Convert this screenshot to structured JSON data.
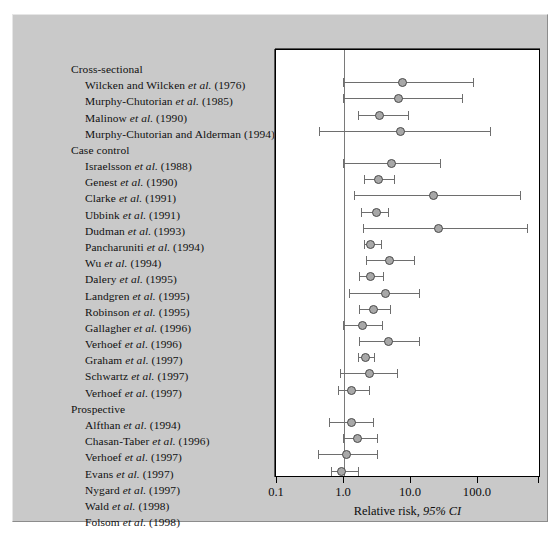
{
  "figure": {
    "background_color": "#c9c9c9",
    "plot_background_color": "#ffffff",
    "marker_color": "#a8a8a8",
    "marker_edge_color": "#4a4a4a",
    "line_color": "#6e6e6e",
    "reference_line_color": "#7a7a7a"
  },
  "axis": {
    "xlabel_plain": "Relative risk,",
    "xlabel_italic": "95% CI",
    "ticks": [
      "0.1",
      "1.0",
      "10.0",
      "100.0"
    ],
    "tick_values": [
      0.1,
      1.0,
      10.0,
      100.0
    ],
    "reference_value": "1.0"
  },
  "groups": [
    {
      "name": "Cross-sectional"
    },
    {
      "name": "Case control"
    },
    {
      "name": "Prospective"
    }
  ],
  "chart_data": {
    "type": "forest",
    "title": "",
    "xlabel": "Relative risk, 95% CI",
    "ylabel": "",
    "xscale": "log",
    "xlim": [
      0.1,
      400
    ],
    "xticks": [
      0.1,
      1.0,
      10.0,
      100.0
    ],
    "xticklabels": [
      "0.1",
      "1.0",
      "10.0",
      "100.0"
    ],
    "reference_line": 1.0,
    "grid": false,
    "legend": null,
    "groups": [
      "Cross-sectional",
      "Case control",
      "Prospective"
    ],
    "rows": [
      {
        "kind": "group",
        "label": "Cross-sectional"
      },
      {
        "kind": "study",
        "group": "Cross-sectional",
        "label_name": "Wilcken and Wilcken",
        "label_etal": "et al.",
        "label_year": "(1976)",
        "label": "Wilcken and Wilcken et al. (1976)",
        "rr": 7.4,
        "ci_low": 0.97,
        "ci_high": 83.0
      },
      {
        "kind": "study",
        "group": "Cross-sectional",
        "label_name": "Murphy-Chutorian",
        "label_etal": "et al.",
        "label_year": "(1985)",
        "label": "Murphy-Chutorian et al. (1985)",
        "rr": 6.5,
        "ci_low": 0.97,
        "ci_high": 58.0
      },
      {
        "kind": "study",
        "group": "Cross-sectional",
        "label_name": "Malinow",
        "label_etal": "et al.",
        "label_year": "(1990)",
        "label": "Malinow et al. (1990)",
        "rr": 3.4,
        "ci_low": 1.6,
        "ci_high": 8.9
      },
      {
        "kind": "study",
        "group": "Cross-sectional",
        "label_name": "Murphy-Chutorian and Alderman",
        "label_etal": "",
        "label_year": "(1994)",
        "label": "Murphy-Chutorian and Alderman (1994)",
        "rr": 6.9,
        "ci_low": 0.43,
        "ci_high": 150.0
      },
      {
        "kind": "group",
        "label": "Case control"
      },
      {
        "kind": "study",
        "group": "Case control",
        "label_name": "Israelsson",
        "label_etal": "et al.",
        "label_year": "(1988)",
        "label": "Israelsson et al. (1988)",
        "rr": 5.2,
        "ci_low": 0.97,
        "ci_high": 27.0
      },
      {
        "kind": "study",
        "group": "Case control",
        "label_name": "Genest",
        "label_etal": "et al.",
        "label_year": "(1990)",
        "label": "Genest et al. (1990)",
        "rr": 3.3,
        "ci_low": 2.0,
        "ci_high": 5.6
      },
      {
        "kind": "study",
        "group": "Case control",
        "label_name": "Clarke",
        "label_etal": "et al.",
        "label_year": "(1991)",
        "label": "Clarke et al. (1991)",
        "rr": 22.0,
        "ci_low": 1.4,
        "ci_high": 420.0
      },
      {
        "kind": "study",
        "group": "Case control",
        "label_name": "Ubbink",
        "label_etal": "et al.",
        "label_year": "(1991)",
        "label": "Ubbink et al. (1991)",
        "rr": 3.1,
        "ci_low": 1.8,
        "ci_high": 4.6
      },
      {
        "kind": "study",
        "group": "Case control",
        "label_name": "Dudman",
        "label_etal": "et al.",
        "label_year": "(1993)",
        "label": "Dudman et al. (1993)",
        "rr": 26.0,
        "ci_low": 1.9,
        "ci_high": 540.0
      },
      {
        "kind": "study",
        "group": "Case control",
        "label_name": "Pancharuniti",
        "label_etal": "et al.",
        "label_year": "(1994)",
        "label": "Pancharuniti et al. (1994)",
        "rr": 2.5,
        "ci_low": 2.0,
        "ci_high": 3.6
      },
      {
        "kind": "study",
        "group": "Case control",
        "label_name": "Wu",
        "label_etal": "et al.",
        "label_year": "(1994)",
        "label": "Wu et al. (1994)",
        "rr": 4.8,
        "ci_low": 2.1,
        "ci_high": 11.0
      },
      {
        "kind": "study",
        "group": "Case control",
        "label_name": "Dalery",
        "label_etal": "et al.",
        "label_year": "(1995)",
        "label": "Dalery et al. (1995)",
        "rr": 2.5,
        "ci_low": 1.7,
        "ci_high": 3.8
      },
      {
        "kind": "study",
        "group": "Case control",
        "label_name": "Landgren",
        "label_etal": "et al.",
        "label_year": "(1995)",
        "label": "Landgren et al. (1995)",
        "rr": 4.1,
        "ci_low": 1.2,
        "ci_high": 13.0
      },
      {
        "kind": "study",
        "group": "Case control",
        "label_name": "Robinson",
        "label_etal": "et al.",
        "label_year": "(1995)",
        "label": "Robinson et al. (1995)",
        "rr": 2.8,
        "ci_low": 1.7,
        "ci_high": 4.8
      },
      {
        "kind": "study",
        "group": "Case control",
        "label_name": "Gallagher",
        "label_etal": "et al.",
        "label_year": "(1996)",
        "label": "Gallagher et al. (1996)",
        "rr": 1.9,
        "ci_low": 0.97,
        "ci_high": 3.7
      },
      {
        "kind": "study",
        "group": "Case control",
        "label_name": "Verhoef",
        "label_etal": "et al.",
        "label_year": "(1996)",
        "label": "Verhoef et al. (1996)",
        "rr": 4.6,
        "ci_low": 1.7,
        "ci_high": 13.0
      },
      {
        "kind": "study",
        "group": "Case control",
        "label_name": "Graham",
        "label_etal": "et al.",
        "label_year": "(1997)",
        "label": "Graham et al. (1997)",
        "rr": 2.1,
        "ci_low": 1.6,
        "ci_high": 2.8
      },
      {
        "kind": "study",
        "group": "Case control",
        "label_name": "Schwartz",
        "label_etal": "et al.",
        "label_year": "(1997)",
        "label": "Schwartz et al. (1997)",
        "rr": 2.4,
        "ci_low": 0.87,
        "ci_high": 6.1
      },
      {
        "kind": "study",
        "group": "Case control",
        "label_name": "Verhoef",
        "label_etal": "et al.",
        "label_year": "(1997)",
        "label": "Verhoef et al. (1997)",
        "rr": 1.3,
        "ci_low": 0.82,
        "ci_high": 2.4
      },
      {
        "kind": "group",
        "label": "Prospective"
      },
      {
        "kind": "study",
        "group": "Prospective",
        "label_name": "Alfthan",
        "label_etal": "et al.",
        "label_year": "(1994)",
        "label": "Alfthan et al. (1994)",
        "rr": 1.3,
        "ci_low": 0.59,
        "ci_high": 2.7
      },
      {
        "kind": "study",
        "group": "Prospective",
        "label_name": "Chasan-Taber",
        "label_etal": "et al.",
        "label_year": "(1996)",
        "label": "Chasan-Taber et al. (1996)",
        "rr": 1.6,
        "ci_low": 0.97,
        "ci_high": 3.1
      },
      {
        "kind": "study",
        "group": "Prospective",
        "label_name": "Verhoef",
        "label_etal": "et al.",
        "label_year": "(1997)",
        "label": "Verhoef et al. (1997)",
        "rr": 1.1,
        "ci_low": 0.41,
        "ci_high": 3.1
      },
      {
        "kind": "study",
        "group": "Prospective",
        "label_name": "Evans",
        "label_etal": "et al.",
        "label_year": "(1997)",
        "label": "Evans et al. (1997)",
        "rr": 0.93,
        "ci_low": 0.63,
        "ci_high": 1.6
      },
      {
        "kind": "study",
        "group": "Prospective",
        "label_name": "Nygard",
        "label_etal": "et al.",
        "label_year": "(1997)",
        "label": "Nygard et al. (1997)",
        "rr": 4.3,
        "ci_low": 1.2,
        "ci_high": 15.0
      },
      {
        "kind": "study",
        "group": "Prospective",
        "label_name": "Wald",
        "label_etal": "et al.",
        "label_year": "(1998)",
        "label": "Wald et al. (1998)",
        "rr": 2.8,
        "ci_low": 1.9,
        "ci_high": 4.2
      },
      {
        "kind": "study",
        "group": "Prospective",
        "label_name": "Folsom",
        "label_etal": "et al.",
        "label_year": "(1998)",
        "label": "Folsom et al. (1998)",
        "rr": 1.3,
        "ci_low": 0.51,
        "ci_high": 3.1
      }
    ]
  }
}
